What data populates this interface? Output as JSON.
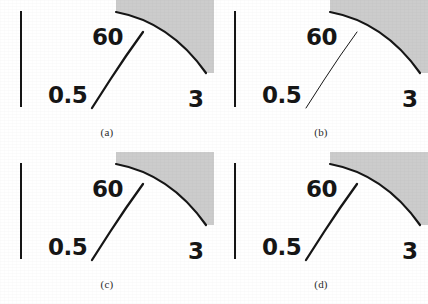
{
  "figure": {
    "background_color": "#ffffff",
    "ink_color": "#161616",
    "shade_color": "#cccccc",
    "panel_count": 4,
    "panel_width": 214,
    "panel_height": 152
  },
  "labels": {
    "upper": "60",
    "lower_left": "0.5",
    "lower_right": "3"
  },
  "geometry": {
    "vertical_bar": {
      "x": 21,
      "y_top": 11,
      "y_bottom": 107,
      "thickness": 2
    },
    "curve": {
      "start_x": 116,
      "start_y": 12,
      "control_x": 170,
      "control_y": 22,
      "end_x": 206,
      "end_y": 73,
      "thickness": 2,
      "shape": "concave-arc"
    },
    "shaded_region": {
      "description": "gray wedge above and right of the curve",
      "color": "#cccccc"
    },
    "diagonal": {
      "start_x": 92,
      "start_y": 108,
      "end_x": 143,
      "end_y": 32,
      "thick_width": 2.3,
      "thin_width": 1.0
    }
  },
  "panels": [
    {
      "id": "a",
      "caption": "(a)",
      "diagonal_weight": "thick",
      "label_60": "60",
      "label_05": "0.5",
      "label_3": "3"
    },
    {
      "id": "b",
      "caption": "(b)",
      "diagonal_weight": "thin",
      "label_60": "60",
      "label_05": "0.5",
      "label_3": "3"
    },
    {
      "id": "c",
      "caption": "(c)",
      "diagonal_weight": "thick",
      "label_60": "60",
      "label_05": "0.5",
      "label_3": "3"
    },
    {
      "id": "d",
      "caption": "(d)",
      "diagonal_weight": "thick",
      "label_60": "60",
      "label_05": "0.5",
      "label_3": "3"
    }
  ]
}
